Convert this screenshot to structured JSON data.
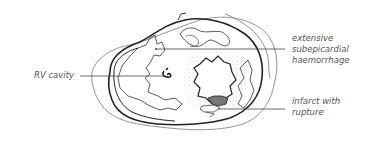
{
  "diagram": {
    "type": "cross-section illustration",
    "labels": {
      "rv_cavity": "RV cavity",
      "haemorrhage_line1": "extensive",
      "haemorrhage_line2": "subepicardial",
      "haemorrhage_line3": "haemorrhage",
      "infarct_line1": "infarct with",
      "infarct_line2": "rupture"
    },
    "colors": {
      "line": "#222222",
      "outer_line": "#888888",
      "text": "#555555",
      "infarct_fill": "#777777",
      "stipple": "#aaaaaa"
    }
  }
}
